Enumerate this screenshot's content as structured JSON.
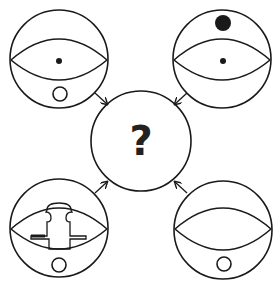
{
  "puzzle": {
    "center": {
      "label": "?"
    },
    "panels": [
      {
        "position": "top-left",
        "features": [
          "eye",
          "center-dot",
          "small-hollow-circle-bottom"
        ]
      },
      {
        "position": "top-right",
        "features": [
          "eye",
          "center-dot",
          "large-black-dot-top"
        ]
      },
      {
        "position": "bottom-left",
        "features": [
          "eye",
          "cross-shaped-outline",
          "small-hollow-circle-bottom"
        ]
      },
      {
        "position": "bottom-right",
        "features": [
          "eye",
          "small-hollow-circle-bottom"
        ]
      }
    ],
    "arrows": [
      "top-left-to-center",
      "top-right-to-center",
      "bottom-left-to-center",
      "bottom-right-to-center"
    ]
  },
  "colors": {
    "stroke": "#1a1a1a",
    "background": "#ffffff"
  }
}
